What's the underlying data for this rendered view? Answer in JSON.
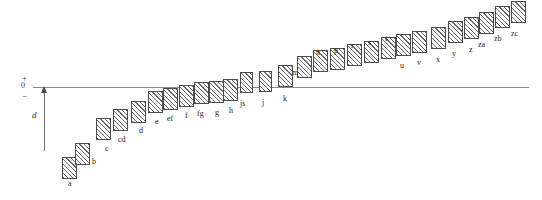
{
  "figure": {
    "title": "",
    "axis": {
      "zero_label": "0",
      "plus_label": "+",
      "minus_label": "−",
      "baseline_y_px": 87
    },
    "annotation": {
      "dimension_label": "d"
    },
    "colors": {
      "axis": "#8a8a8a",
      "mark_border": "#4d4d4d",
      "hatch": "#6b6b6b",
      "background": "#ffffff",
      "text": "#1d1d1d"
    }
  },
  "chart_data": {
    "type": "bar",
    "title": "",
    "subtitle": "",
    "xlabel": "",
    "ylabel": "",
    "grid": false,
    "legend": null,
    "orientation": "vertical",
    "baseline": 0,
    "note": "Each category is drawn as a hatched rectangle whose vertical span runs from 'low' to 'high' on the signed axis (0 = horizontal reference line, + above, − below). Values are read off the zero line in arbitrary units (pixels below/above baseline converted to axis units).",
    "ylim": [
      -75,
      80
    ],
    "categories": [
      "a",
      "b",
      "c",
      "cd",
      "d",
      "e",
      "ef",
      "f",
      "fg",
      "g",
      "h",
      "js",
      "j",
      "k",
      "m",
      "n",
      "p",
      "r",
      "s",
      "t",
      "u",
      "v",
      "x",
      "y",
      "z",
      "za",
      "zb",
      "zc"
    ],
    "values": [
      -60,
      -51,
      -34,
      -28,
      -22,
      -16,
      -14,
      -12,
      -10,
      -9,
      -8,
      -2,
      -1,
      4,
      11,
      16,
      18,
      22,
      25,
      29,
      32,
      35,
      39,
      45,
      49,
      54,
      60,
      66
    ],
    "low": [
      -71,
      -62,
      -45,
      -39,
      -34,
      -27,
      -25,
      -23,
      -21,
      -20,
      -19,
      -13,
      -12,
      -8,
      -1,
      4,
      6,
      10,
      13,
      17,
      20,
      23,
      27,
      33,
      37,
      42,
      48,
      54
    ],
    "high": [
      -49,
      -40,
      -23,
      -17,
      -11,
      -5,
      -3,
      -1,
      1,
      2,
      3,
      9,
      10,
      16,
      23,
      28,
      30,
      34,
      37,
      41,
      44,
      47,
      51,
      57,
      61,
      66,
      72,
      78
    ],
    "annotations": [
      {
        "text": "d",
        "kind": "dimension-arrow",
        "description": "vertical extent measured upward from the lowest mark to the zero line"
      }
    ]
  },
  "marks": [
    {
      "label": "a",
      "x": 62,
      "y": 157,
      "w": 15,
      "h": 22,
      "lx": 68,
      "ly": 180
    },
    {
      "label": "b",
      "x": 75,
      "y": 143,
      "w": 15,
      "h": 22,
      "lx": 92,
      "ly": 158
    },
    {
      "label": "c",
      "x": 96,
      "y": 118,
      "w": 15,
      "h": 22,
      "lx": 105,
      "ly": 145
    },
    {
      "label": "cd",
      "x": 113,
      "y": 109,
      "w": 15,
      "h": 22,
      "lx": 118,
      "ly": 136
    },
    {
      "label": "d",
      "x": 131,
      "y": 101,
      "w": 15,
      "h": 22,
      "lx": 139,
      "ly": 127
    },
    {
      "label": "e",
      "x": 148,
      "y": 91,
      "w": 15,
      "h": 22,
      "lx": 155,
      "ly": 118
    },
    {
      "label": "ef",
      "x": 163,
      "y": 88,
      "w": 15,
      "h": 22,
      "lx": 167,
      "ly": 115
    },
    {
      "label": "f",
      "x": 179,
      "y": 85,
      "w": 15,
      "h": 22,
      "lx": 185,
      "ly": 112
    },
    {
      "label": "fg",
      "x": 194,
      "y": 82,
      "w": 15,
      "h": 22,
      "lx": 197,
      "ly": 110
    },
    {
      "label": "g",
      "x": 209,
      "y": 81,
      "w": 15,
      "h": 22,
      "lx": 215,
      "ly": 109
    },
    {
      "label": "h",
      "x": 223,
      "y": 79,
      "w": 15,
      "h": 22,
      "lx": 229,
      "ly": 107
    },
    {
      "label": "js",
      "x": 240,
      "y": 72,
      "w": 13,
      "h": 21,
      "lx": 240,
      "ly": 100
    },
    {
      "label": "j",
      "x": 259,
      "y": 71,
      "w": 13,
      "h": 21,
      "lx": 262,
      "ly": 99
    },
    {
      "label": "k",
      "x": 278,
      "y": 65,
      "w": 15,
      "h": 22,
      "lx": 283,
      "ly": 95
    },
    {
      "label": "m",
      "x": 297,
      "y": 56,
      "w": 15,
      "h": 22,
      "lx": 292,
      "ly": 69
    },
    {
      "label": "n",
      "x": 313,
      "y": 50,
      "w": 15,
      "h": 22,
      "lx": 316,
      "ly": 49
    },
    {
      "label": "p",
      "x": 330,
      "y": 48,
      "w": 15,
      "h": 22,
      "lx": 334,
      "ly": 47
    },
    {
      "label": "r",
      "x": 347,
      "y": 44,
      "w": 15,
      "h": 22,
      "lx": 351,
      "ly": 42
    },
    {
      "label": "s",
      "x": 364,
      "y": 41,
      "w": 15,
      "h": 22,
      "lx": 368,
      "ly": 39
    },
    {
      "label": "t",
      "x": 381,
      "y": 37,
      "w": 15,
      "h": 22,
      "lx": 385,
      "ly": 35
    },
    {
      "label": "u",
      "x": 396,
      "y": 34,
      "w": 15,
      "h": 22,
      "lx": 400,
      "ly": 62
    },
    {
      "label": "v",
      "x": 412,
      "y": 31,
      "w": 15,
      "h": 22,
      "lx": 417,
      "ly": 59
    },
    {
      "label": "x",
      "x": 431,
      "y": 27,
      "w": 15,
      "h": 22,
      "lx": 436,
      "ly": 56
    },
    {
      "label": "y",
      "x": 448,
      "y": 21,
      "w": 15,
      "h": 22,
      "lx": 452,
      "ly": 50
    },
    {
      "label": "z",
      "x": 464,
      "y": 17,
      "w": 15,
      "h": 22,
      "lx": 469,
      "ly": 46
    },
    {
      "label": "za",
      "x": 479,
      "y": 12,
      "w": 15,
      "h": 22,
      "lx": 478,
      "ly": 41
    },
    {
      "label": "zb",
      "x": 495,
      "y": 6,
      "w": 15,
      "h": 22,
      "lx": 494,
      "ly": 35
    },
    {
      "label": "zc",
      "x": 511,
      "y": 1,
      "w": 15,
      "h": 22,
      "lx": 511,
      "ly": 30
    }
  ]
}
